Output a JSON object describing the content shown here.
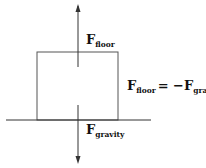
{
  "diagram": {
    "colors": {
      "stroke": "#333333",
      "text": "#111111",
      "background": "#ffffff"
    },
    "forces": [
      {
        "id": "floor",
        "symbol": "F",
        "subscript": "floor",
        "direction": "up"
      },
      {
        "id": "gravity",
        "symbol": "F",
        "subscript": "gravity",
        "direction": "down"
      }
    ],
    "equation": {
      "lhs_symbol": "F",
      "lhs_subscript": "floor",
      "operator": "= −",
      "rhs_symbol": "F",
      "rhs_subscript": "gravity"
    },
    "objects": [
      {
        "id": "block",
        "kind": "rectangle"
      },
      {
        "id": "floor-line",
        "kind": "line"
      }
    ]
  }
}
